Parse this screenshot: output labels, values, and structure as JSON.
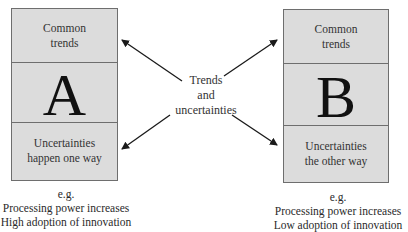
{
  "diagram": {
    "center_label": [
      "Trends",
      "and",
      "uncertainties"
    ],
    "scenarios": [
      {
        "id": "A",
        "letter": "A",
        "top": [
          "Common",
          "trends"
        ],
        "bottom": [
          "Uncertainties",
          "happen one way"
        ],
        "caption": [
          "e.g.",
          "Processing power increases",
          "High adoption of innovation"
        ]
      },
      {
        "id": "B",
        "letter": "B",
        "top": [
          "Common",
          "trends"
        ],
        "bottom": [
          "Uncertainties",
          "the other way"
        ],
        "caption": [
          "e.g.",
          "Processing power increases",
          "Low adoption of innovation"
        ]
      }
    ],
    "colors": {
      "box_fill": "#dcdcdc",
      "box_border": "#6e6e6e",
      "arrow": "#1a1a1a"
    }
  }
}
